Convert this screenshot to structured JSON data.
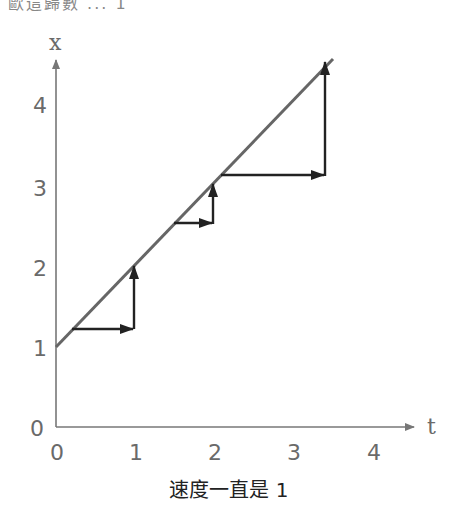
{
  "top_clip_text": "歐這歸數 ...  1",
  "diagram": {
    "x_axis_label": "t",
    "y_axis_label": "x",
    "x_ticks": [
      "0",
      "1",
      "2",
      "3",
      "4"
    ],
    "y_ticks": [
      "0",
      "1",
      "2",
      "3",
      "4"
    ],
    "line": {
      "from": [
        0,
        1
      ],
      "to": [
        3.5,
        4.5
      ],
      "color": "#666666"
    },
    "step_arrows": [
      {
        "horizontal": {
          "from": [
            0.2,
            1.2
          ],
          "to": [
            1.0,
            1.2
          ]
        },
        "vertical": {
          "from": [
            1.0,
            1.2
          ],
          "to": [
            1.0,
            2.0
          ]
        }
      },
      {
        "horizontal": {
          "from": [
            1.5,
            2.5
          ],
          "to": [
            2.0,
            2.5
          ]
        },
        "vertical": {
          "from": [
            2.0,
            2.5
          ],
          "to": [
            2.0,
            3.0
          ]
        }
      },
      {
        "horizontal": {
          "from": [
            2.1,
            3.1
          ],
          "to": [
            3.4,
            3.1
          ]
        },
        "vertical": {
          "from": [
            3.4,
            3.1
          ],
          "to": [
            3.4,
            4.5
          ]
        }
      }
    ],
    "arrow_color": "#222222",
    "axis_color": "#777777"
  },
  "caption": "速度一直是 1"
}
